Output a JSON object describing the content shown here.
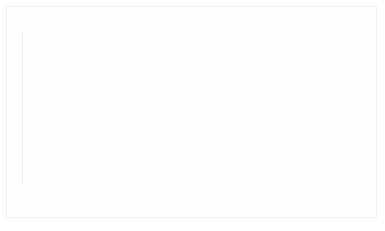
{
  "chart_data": {
    "type": "bar",
    "title": "",
    "subtitle": "",
    "xlabel": "",
    "ylabel": "",
    "stacked": true,
    "stack_total": "100%",
    "ylim": [
      0,
      100
    ],
    "grid": false,
    "legend_position": "bottom",
    "categories": [
      "feb-16",
      "mar-16",
      "apr-16",
      "may-16",
      "june-16",
      "july-16",
      "aug-16",
      "sept-16",
      "oct-16",
      "nov-16",
      "dec-16",
      "jan-17"
    ],
    "series": [
      {
        "name": "Smartworkers managers",
        "color": "#9a9a9a",
        "values": [
          28,
          29,
          30,
          31,
          31,
          29,
          26,
          26,
          26,
          26,
          23,
          19
        ],
        "labels": [
          "28%",
          "29%",
          "30%",
          "31%",
          "31%",
          "29%",
          "26%",
          "26%",
          "26%",
          "26%",
          "23%",
          "19%"
        ]
      },
      {
        "name": "Other managers",
        "color": "#dddddd",
        "values": [
          72,
          71,
          70,
          69,
          69,
          71,
          74,
          74,
          74,
          74,
          77,
          81
        ],
        "labels": [
          "72%",
          "71%",
          "70%",
          "69%",
          "69%",
          "71%",
          "74%",
          "74%",
          "74%",
          "74%",
          "77%",
          "81%"
        ]
      }
    ]
  },
  "legend": {
    "items": [
      {
        "label": "Smartworkers managers",
        "swatch": "legend-swatch-dark"
      },
      {
        "label": "Other managers",
        "swatch": "legend-swatch-light"
      }
    ]
  }
}
